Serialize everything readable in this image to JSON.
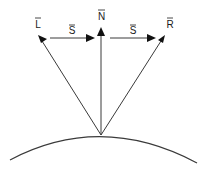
{
  "diagram": {
    "colors": {
      "line": "#3a3a3a",
      "arrowhead": "#111111",
      "text": "#1a1a1a",
      "background": "#ffffff"
    },
    "origin": {
      "x": 101,
      "y": 135
    },
    "vectors": [
      {
        "id": "L",
        "label": "L",
        "overbar": true,
        "from": [
          101,
          135
        ],
        "to": [
          39,
          36
        ]
      },
      {
        "id": "N",
        "label": "N",
        "overbar": true,
        "from": [
          101,
          135
        ],
        "to": [
          101,
          28
        ]
      },
      {
        "id": "R",
        "label": "R",
        "overbar": true,
        "from": [
          101,
          135
        ],
        "to": [
          164,
          36
        ]
      },
      {
        "id": "S1",
        "label": "S",
        "overbar": true,
        "from": [
          50,
          38
        ],
        "to": [
          94,
          38
        ]
      },
      {
        "id": "S2",
        "label": "S",
        "overbar": true,
        "from": [
          110,
          38
        ],
        "to": [
          155,
          38
        ]
      }
    ],
    "labels": {
      "L": "L",
      "N": "N",
      "R": "R",
      "S_left": "S",
      "S_right": "S"
    },
    "surface": {
      "type": "convex-arc",
      "start": [
        10,
        160
      ],
      "apex": [
        101,
        135
      ],
      "end": [
        197,
        163
      ]
    }
  }
}
